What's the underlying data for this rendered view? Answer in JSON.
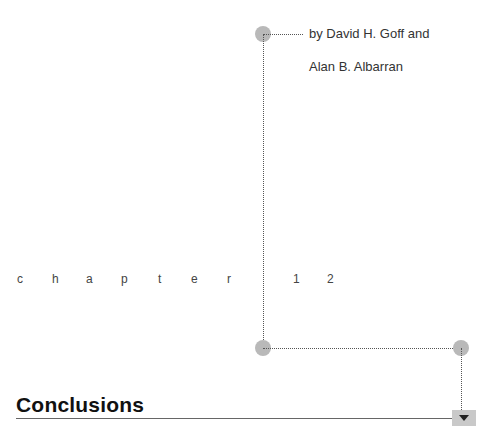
{
  "byline": {
    "line1": "by David H. Goff and",
    "line2": "Alan B. Albarran"
  },
  "chapter": {
    "letters": [
      "c",
      "h",
      "a",
      "p",
      "t",
      "e",
      "r"
    ],
    "number_digits": [
      "1",
      "2"
    ]
  },
  "section": {
    "heading": "Conclusions"
  },
  "controls": {
    "next_icon": "down-arrow-icon"
  }
}
